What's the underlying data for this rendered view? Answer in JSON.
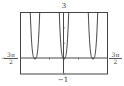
{
  "chart_data": {
    "type": "line",
    "title": "",
    "xlabel": "",
    "ylabel": "",
    "xlim": [
      "-3π/2",
      "3π/2"
    ],
    "xlim_numeric": [
      -4.712,
      4.712
    ],
    "ylim": [
      -1,
      3
    ],
    "grid": false,
    "legend": null,
    "x_tick_labels": {
      "left": {
        "sign": "−",
        "num": "3π",
        "den": "2"
      },
      "right": {
        "num": "3π",
        "den": "2"
      }
    },
    "y_tick_labels": {
      "top": "3",
      "bottom": "−1"
    },
    "series": [
      {
        "name": "curve",
        "description": "Three U-shaped branches with minima y=0 at x=−π, 0, π, rising steeply to y=3",
        "minima_x": [
          -3.1416,
          0,
          3.1416
        ],
        "minimum_y": 0,
        "half_width_at_top_rad": 0.51,
        "points_per_branch_offset_rad": [
          -0.51,
          -0.4,
          -0.3,
          -0.2,
          -0.1,
          0,
          0.1,
          0.2,
          0.3,
          0.4,
          0.51
        ],
        "points_per_branch_y": [
          3.0,
          1.45,
          0.61,
          0.18,
          0.02,
          0,
          0.02,
          0.18,
          0.61,
          1.45,
          3.0
        ]
      }
    ]
  },
  "labels": {
    "y_top": "3",
    "y_bottom": "−1",
    "x_left_sign": "−",
    "x_left_num": "3π",
    "x_left_den": "2",
    "x_right_num": "3π",
    "x_right_den": "2"
  }
}
